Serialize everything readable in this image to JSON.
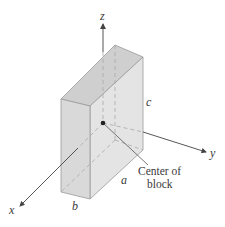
{
  "diagram": {
    "axes": {
      "x_label": "x",
      "y_label": "y",
      "z_label": "z"
    },
    "dimensions": {
      "a_label": "a",
      "b_label": "b",
      "c_label": "c"
    },
    "annotation": {
      "line1": "Center of",
      "line2": "block"
    },
    "colors": {
      "block_front": "#dcdcdc",
      "block_top": "#cfcfcf",
      "block_side": "#e6e6e6",
      "edge": "#9a9a9a",
      "axis": "#444444",
      "hidden": "#a8a8a8"
    }
  }
}
